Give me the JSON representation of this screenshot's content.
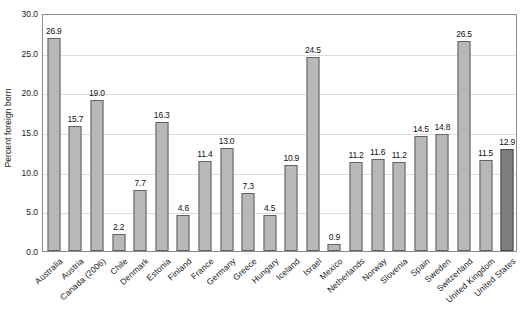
{
  "chart_data": {
    "type": "bar",
    "title": "",
    "xlabel": "",
    "ylabel": "Percent foreign born",
    "ylim": [
      0.0,
      30.0
    ],
    "yticks": [
      "0.0",
      "5.0",
      "10.0",
      "15.0",
      "20.0",
      "25.0",
      "30.0"
    ],
    "ytick_values": [
      0.0,
      5.0,
      10.0,
      15.0,
      20.0,
      25.0,
      30.0
    ],
    "grid": true,
    "legend": "none",
    "categories": [
      "Australia",
      "Austria",
      "Canada (2006)",
      "Chile",
      "Denmark",
      "Estonia",
      "Finland",
      "France",
      "Germany",
      "Greece",
      "Hungary",
      "Iceland",
      "Israel",
      "Mexico",
      "Netherlands",
      "Norway",
      "Slovenia",
      "Spain",
      "Sweden",
      "Switzerland",
      "United Kingdom",
      "United States"
    ],
    "values": [
      26.9,
      15.7,
      19.0,
      2.2,
      7.7,
      16.3,
      4.6,
      11.4,
      13.0,
      7.3,
      4.5,
      10.9,
      24.5,
      0.9,
      11.2,
      11.6,
      11.2,
      14.5,
      14.8,
      26.5,
      11.5,
      12.9
    ],
    "value_labels": [
      "26.9",
      "15.7",
      "19.0",
      "2.2",
      "7.7",
      "16.3",
      "4.6",
      "11.4",
      "13.0",
      "7.3",
      "4.5",
      "10.9",
      "24.5",
      "0.9",
      "11.2",
      "11.6",
      "11.2",
      "14.5",
      "14.8",
      "26.5",
      "11.5",
      "12.9"
    ],
    "highlight_index": 21,
    "colors": {
      "bar_fill": "#b8b8b8",
      "bar_border": "#636363",
      "highlight_fill": "#7e7e7e",
      "highlight_border": "#4a4a4a",
      "gridline": "#dcdcdc",
      "plot_border": "#8c8c8c",
      "text": "#1a1a1a",
      "background": "#ffffff"
    }
  }
}
